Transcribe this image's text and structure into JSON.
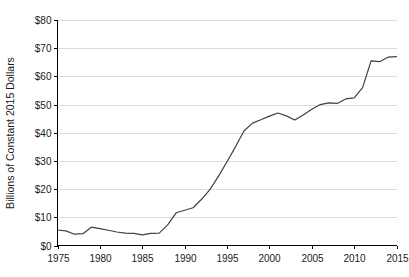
{
  "chart_data": {
    "type": "line",
    "title": "",
    "subtitle": "",
    "xlabel": "",
    "ylabel": "Billions of Constant 2015 Dollars",
    "xlim": [
      1975,
      2015
    ],
    "ylim": [
      0,
      80
    ],
    "grid": "horizontal",
    "legend": "none",
    "x_tick_labels": [
      "1975",
      "1980",
      "1985",
      "1990",
      "1995",
      "2000",
      "2005",
      "2010",
      "2015"
    ],
    "x_tick_values": [
      1975,
      1980,
      1985,
      1990,
      1995,
      2000,
      2005,
      2010,
      2015
    ],
    "y_tick_labels": [
      "$0",
      "$10",
      "$20",
      "$30",
      "$40",
      "$50",
      "$60",
      "$70",
      "$80"
    ],
    "y_tick_values": [
      0,
      10,
      20,
      30,
      40,
      50,
      60,
      70,
      80
    ],
    "series": [
      {
        "name": "",
        "color": "#404040",
        "x": [
          1975,
          1976,
          1977,
          1978,
          1979,
          1980,
          1981,
          1982,
          1983,
          1984,
          1985,
          1986,
          1987,
          1988,
          1989,
          1990,
          1991,
          1992,
          1993,
          1994,
          1995,
          1996,
          1997,
          1998,
          1999,
          2000,
          2001,
          2002,
          2003,
          2004,
          2005,
          2006,
          2007,
          2008,
          2009,
          2010,
          2011,
          2012,
          2013,
          2014,
          2015
        ],
        "values": [
          5.5,
          5.2,
          4.0,
          4.2,
          6.5,
          6.0,
          5.4,
          4.8,
          4.4,
          4.3,
          3.8,
          4.3,
          4.4,
          7.3,
          11.6,
          12.5,
          13.4,
          16.4,
          19.9,
          24.6,
          29.7,
          35.0,
          40.6,
          43.4,
          44.6,
          45.9,
          47.0,
          46.0,
          44.5,
          46.3,
          48.3,
          50.0,
          50.6,
          50.4,
          52.0,
          52.4,
          56.0,
          65.5,
          65.2,
          66.8,
          67.0
        ]
      }
    ],
    "colors": {
      "line": "#404040",
      "gridline": "#d3d3d3",
      "axis": "#000000",
      "text": "#1a1a1a",
      "background": "#ffffff"
    }
  }
}
